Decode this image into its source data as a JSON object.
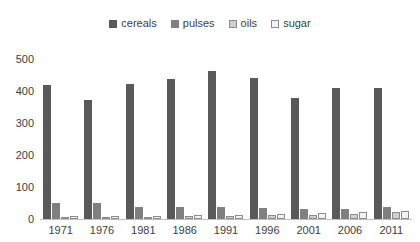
{
  "chart_data": {
    "type": "bar",
    "title": "",
    "xlabel": "",
    "ylabel": "",
    "ylim": [
      0,
      500
    ],
    "yticks": [
      0,
      100,
      200,
      300,
      400,
      500
    ],
    "grid": false,
    "legend_position": "top-center",
    "categories": [
      "1971",
      "1976",
      "1981",
      "1986",
      "1991",
      "1996",
      "2001",
      "2006",
      "2011"
    ],
    "series": [
      {
        "name": "cereals",
        "color": "#595959",
        "values": [
          420,
          373,
          423,
          436,
          464,
          441,
          379,
          410,
          409
        ]
      },
      {
        "name": "pulses",
        "color": "#808080",
        "values": [
          51,
          51,
          37,
          36,
          36,
          33,
          30,
          32,
          39
        ]
      },
      {
        "name": "oils",
        "color": "#d0d0d0",
        "values": [
          5,
          5,
          6,
          8,
          10,
          12,
          14,
          17,
          21
        ]
      },
      {
        "name": "sugar",
        "color": "#f2f2f2",
        "values": [
          8,
          8,
          9,
          12,
          13,
          16,
          19,
          22,
          24
        ]
      }
    ]
  },
  "legend": {
    "items": [
      {
        "label": "cereals"
      },
      {
        "label": "pulses"
      },
      {
        "label": "oils"
      },
      {
        "label": "sugar"
      }
    ]
  }
}
